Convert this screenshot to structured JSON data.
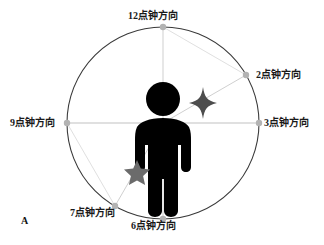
{
  "figure": {
    "panel_letter": "A",
    "background_color": "#ffffff"
  },
  "diagram": {
    "type": "clock-direction-diagram",
    "circle": {
      "center_x": 163,
      "center_y": 123,
      "radius": 96,
      "stroke_color": "#3a3a3a"
    },
    "marker_color": "#b0b0b0",
    "ray_color": "#c8c8c8",
    "center_figure": {
      "name": "human-pictogram",
      "color": "#000000"
    },
    "directions": [
      {
        "key": "12",
        "label": "12点钟方向",
        "angle_deg": 0,
        "marker_x": 163,
        "marker_y": 27
      },
      {
        "key": "2",
        "label": "2点钟方向",
        "angle_deg": 60,
        "marker_x": 246,
        "marker_y": 75
      },
      {
        "key": "3",
        "label": "3点钟方向",
        "angle_deg": 90,
        "marker_x": 259,
        "marker_y": 123
      },
      {
        "key": "6",
        "label": "6点钟方向",
        "angle_deg": 180,
        "marker_x": 163,
        "marker_y": 219
      },
      {
        "key": "7",
        "label": "7点钟方向",
        "angle_deg": 210,
        "marker_x": 115,
        "marker_y": 206
      },
      {
        "key": "9",
        "label": "9点钟方向",
        "angle_deg": 270,
        "marker_x": 67,
        "marker_y": 123
      }
    ],
    "stars": [
      {
        "name": "sparkle-star",
        "points": 4,
        "x": 203,
        "y": 103,
        "size": 22,
        "color": "#4d4d4d"
      },
      {
        "name": "five-point-star",
        "points": 5,
        "x": 137,
        "y": 172,
        "size": 24,
        "color": "#6b6b6b"
      }
    ]
  }
}
